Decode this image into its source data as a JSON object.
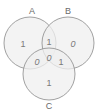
{
  "diagram": {
    "type": "venn-3",
    "colors": {
      "fill": "#efefef",
      "stroke": "#8a8a8a",
      "text": "#707070"
    },
    "sets": [
      {
        "id": "A",
        "label": "A",
        "cx": 30,
        "cy": 43,
        "r": 26
      },
      {
        "id": "B",
        "label": "B",
        "cx": 68,
        "cy": 43,
        "r": 26
      },
      {
        "id": "C",
        "label": "C",
        "cx": 49,
        "cy": 74,
        "r": 26
      }
    ],
    "regions": {
      "A_only": "1",
      "B_only": "0",
      "C_only": "1",
      "A_and_B": "1",
      "A_and_C": "0",
      "B_and_C": "1",
      "A_and_B_and_C": "0"
    }
  }
}
